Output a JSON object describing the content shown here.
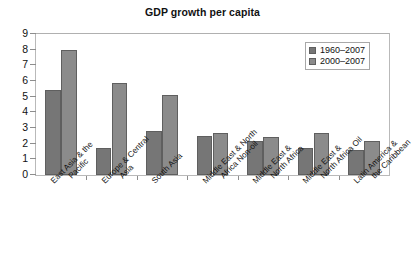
{
  "chart_data": {
    "type": "bar",
    "title": "GDP growth per capita",
    "xlabel": "",
    "ylabel": "",
    "ylim": [
      0,
      9
    ],
    "yticks": [
      0,
      1,
      2,
      3,
      4,
      5,
      6,
      7,
      8,
      9
    ],
    "grid": false,
    "legend_position": "top-right",
    "categories": [
      "East Asia & the Pacific",
      "Europe & Central Asia",
      "South Asia",
      "Middle East & North Africa Non-oil",
      "Middle East & North Africa",
      "Middle East & North Africa Oil",
      "Latin America & the Caribbean"
    ],
    "category_lines": [
      [
        "East Asia & the",
        "Pacific"
      ],
      [
        "Europe & Central",
        "Asia"
      ],
      [
        "South Asia",
        ""
      ],
      [
        "Middle East & North",
        "Africa Non-oil"
      ],
      [
        "Middle East &",
        "North Africa"
      ],
      [
        "Middle East &",
        "North Africa Oil"
      ],
      [
        "Latin America &",
        "the Caribbean"
      ]
    ],
    "series": [
      {
        "name": "1960–2007",
        "color": "#767676",
        "values": [
          5.4,
          1.7,
          2.8,
          2.5,
          2.2,
          1.7,
          1.6
        ]
      },
      {
        "name": "2000–2007",
        "color": "#8b8b8b",
        "values": [
          8.0,
          5.9,
          5.1,
          2.7,
          2.4,
          2.7,
          2.2
        ]
      }
    ]
  },
  "legend": {
    "entries": [
      {
        "label": "1960–2007"
      },
      {
        "label": "2000–2007"
      }
    ]
  }
}
